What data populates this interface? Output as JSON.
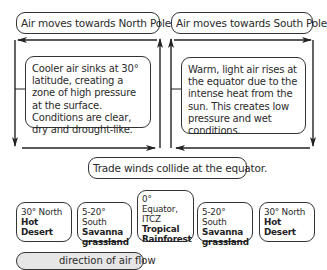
{
  "top_labels": {
    "north": "Air moves towards North Pole.",
    "south": "Air moves towards South Pole."
  },
  "left_panel": {
    "text": "Cooler air sinks at 30° latitude, creating a zone of high pressure at the surface. Conditions are clear, dry and drought-like."
  },
  "right_panel": {
    "text": "Warm, light air rises at the equator due to the intense heat from the sun. This creates low pressure and wet conditions."
  },
  "collision_label": "Trade winds collide at the equator.",
  "biomes": [
    {
      "location": "30° North",
      "name": "Hot Desert"
    },
    {
      "location": "5-20° South",
      "name": "Savanna grassland"
    },
    {
      "location": "0° Equator, ITCZ",
      "name": "Tropical Rainforest"
    },
    {
      "location": "5-20° South",
      "name": "Savanna grassland"
    },
    {
      "location": "30° North",
      "name": "Hot Desert"
    }
  ],
  "legend": {
    "icon": "arrow-right-icon",
    "label": "direction of air flow"
  },
  "colors": {
    "line": "#222222",
    "legend_fill": "#e6e6e6"
  }
}
